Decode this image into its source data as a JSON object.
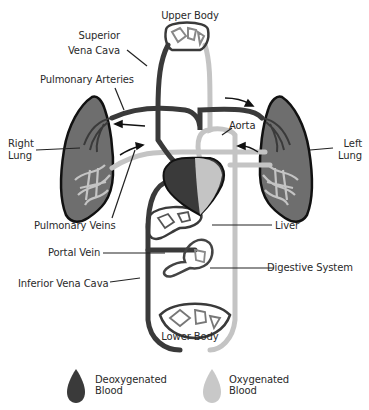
{
  "diagram": {
    "labels": {
      "upper_body": "Upper Body",
      "superior_vena_cava_1": "Superior",
      "superior_vena_cava_2": "Vena Cava",
      "pulmonary_arteries": "Pulmonary Arteries",
      "right_lung_1": "Right",
      "right_lung_2": "Lung",
      "left_lung_1": "Left",
      "left_lung_2": "Lung",
      "aorta": "Aorta",
      "pulmonary_veins": "Pulmonary Veins",
      "liver": "Liver",
      "portal_vein": "Portal Vein",
      "digestive_system": "Digestive System",
      "inferior_vena_cava": "Inferior Vena Cava",
      "lower_body": "Lower Body"
    },
    "colors": {
      "deoxygenated": "#3a3a3a",
      "oxygenated": "#c4c4c4",
      "lung_fill": "#6a6a6a",
      "outline": "#111111"
    }
  },
  "legend": {
    "items": [
      {
        "line1": "Deoxygenated",
        "line2": "Blood",
        "icon": "dark-blood-drop-icon",
        "color": "#3a3a3a"
      },
      {
        "line1": "Oxygenated",
        "line2": "Blood",
        "icon": "light-blood-drop-icon",
        "color": "#c8c8c8"
      }
    ]
  }
}
